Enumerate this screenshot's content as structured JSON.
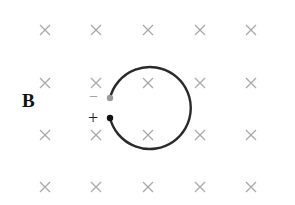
{
  "diagram": {
    "field_label": "B",
    "field_symbol": "×",
    "field_marks": {
      "columns_x": [
        45,
        96,
        148,
        200,
        251
      ],
      "rows_y": [
        30,
        83,
        135,
        187
      ]
    },
    "loop": {
      "cx": 148,
      "cy": 107,
      "r": 41
    },
    "terminals": [
      {
        "sign": "−",
        "x": 110,
        "y": 98,
        "color": "#9a9a9a"
      },
      {
        "sign": "+",
        "x": 110,
        "y": 118,
        "color": "#111111"
      }
    ],
    "colors": {
      "cross": "#a8a8a8",
      "wire": "#2a2a2a"
    }
  }
}
